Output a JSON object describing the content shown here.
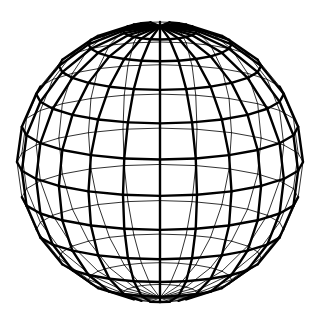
{
  "figure": {
    "background": "#ffffff",
    "line_color": "#000000",
    "center": [
      160,
      162
    ],
    "radius_x": 143,
    "radius_y": 140,
    "tilt_deg": 14,
    "latitude_count": 11,
    "meridian_count": 24,
    "segments": 24,
    "front_stroke_width": 2.4,
    "back_stroke_width": 0.9
  }
}
